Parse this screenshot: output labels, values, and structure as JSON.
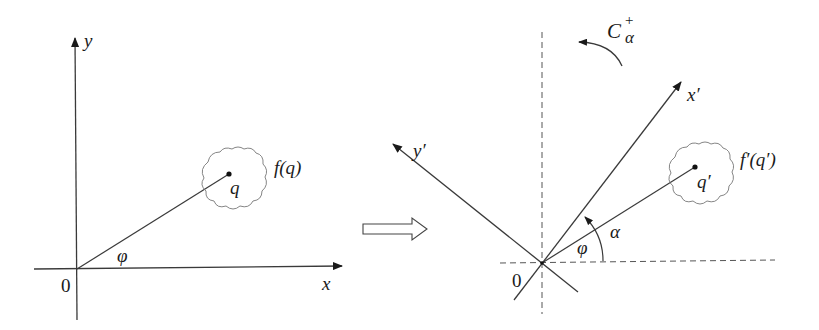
{
  "diagram": {
    "colors": {
      "line": "#3a3a3a",
      "text": "#1a1a1a",
      "dashed": "#555555",
      "background": "#ffffff"
    },
    "left_panel": {
      "x_axis_label": "x",
      "y_axis_label": "y",
      "origin_label": "0",
      "angle_label": "φ",
      "point_label": "q",
      "function_label": "f(q)"
    },
    "transition_arrow": "hollow-right-arrow",
    "right_panel": {
      "x_axis_label": "x′",
      "y_axis_label": "y′",
      "origin_label": "0",
      "angle_phi_label": "φ",
      "angle_alpha_label": "α",
      "point_label": "q′",
      "function_label": "f′(q′)",
      "operator_label_base": "C",
      "operator_label_sup": "+",
      "operator_label_sub": "α",
      "reference_axes": "dashed"
    }
  }
}
